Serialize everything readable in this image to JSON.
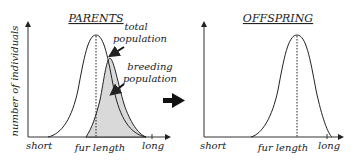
{
  "parents": {
    "title": "PARENTS",
    "y_label": "number of individuals",
    "x_label": "fur length",
    "x_min_label": "short",
    "x_max_label": "long",
    "annotation_total": [
      "total",
      "population"
    ],
    "annotation_breeding": [
      "breeding",
      "population"
    ]
  },
  "offspring": {
    "title": "OFFSPRING",
    "x_label": "fur length",
    "x_min_label": "short",
    "x_max_label": "long"
  },
  "colors": {
    "line": "#222222",
    "shade": "#d9d9d9"
  }
}
